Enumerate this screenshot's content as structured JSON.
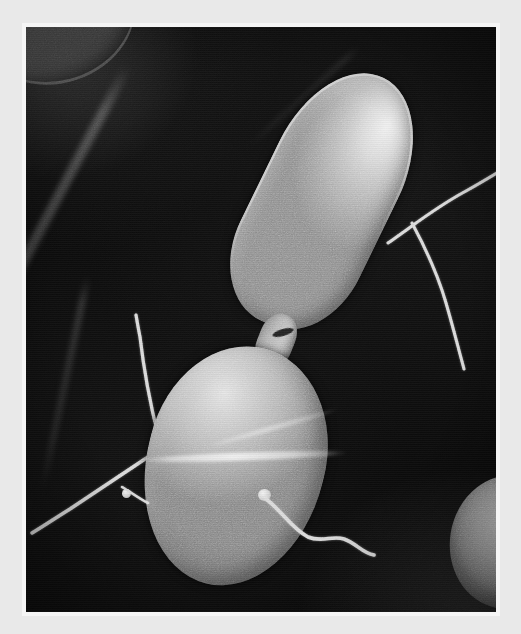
{
  "image": {
    "kind": "sem-micrograph",
    "subject": "two dividing rod-shaped bacteria with flagella",
    "modality": "scanning electron microscope",
    "color_mode": "grayscale",
    "caption": "",
    "width_px": 521,
    "height_px": 634
  },
  "frame": {
    "mat_color": "#e9e9e9",
    "bevel_color": "#f5f5f5",
    "photo_left": 26,
    "photo_top": 27,
    "photo_width": 470,
    "photo_height": 585
  },
  "palette": {
    "background_black": "#0a0a0a",
    "substrate_gray": "#1c1c1c",
    "cell_midtone": "#b4b4b4",
    "cell_highlight": "#efefef",
    "cell_shadow": "#868686",
    "filament_white": "#d8d8d8",
    "corner_cell_dim": "#585858"
  },
  "features": {
    "cells": [
      {
        "id": "cell-upper",
        "label": "upper elongated bacterium",
        "shape": "rod / elongated ovoid",
        "rotation_deg": 26,
        "x": 232,
        "y": 37,
        "w": 132,
        "h": 272
      },
      {
        "id": "cell-lower",
        "label": "lower rounded bacterium",
        "shape": "ovoid / coccobacillus",
        "rotation_deg": 14,
        "x": 120,
        "y": 318,
        "w": 178,
        "h": 242
      },
      {
        "id": "cell-corner-tl",
        "label": "partial out-of-focus cell, top-left corner",
        "shape": "partial rod",
        "rotation_deg": -18,
        "x": -48,
        "y": -62,
        "w": 160,
        "h": 118
      },
      {
        "id": "cell-corner-br",
        "label": "partial bright cell, bottom-right edge",
        "shape": "partial ovoid",
        "rotation_deg": 10,
        "x": 424,
        "y": 448,
        "w": 118,
        "h": 134
      }
    ],
    "neck": {
      "id": "cell-neck",
      "label": "septum joining the two cells",
      "x": 232,
      "y": 286,
      "w": 36,
      "h": 56,
      "rotation_deg": 22
    },
    "filaments": [
      {
        "id": "flagellum-upper-right-a",
        "label": "flagellum from upper cell, trailing up-right",
        "path": "M 0,96 C 26,78 48,60 78,44 C 98,33 112,24 132,12",
        "width": 3.0
      },
      {
        "id": "flagellum-upper-right-b",
        "label": "flagellum from upper cell, trailing down-right",
        "path": "M 0,0 C 14,26 26,52 34,80 C 41,104 46,124 52,146",
        "width": 3.0
      },
      {
        "id": "fimbria-lower-up",
        "label": "filament from lower cell, pointing up",
        "path": "M 28,120 C 20,88 14,56 10,22 C 8,12 7,6 6,0",
        "width": 3.2
      },
      {
        "id": "fimbria-lower-left",
        "label": "filament from lower cell, pointing down-left",
        "path": "M 128,2 C 98,22 68,42 38,62 C 22,72 10,80 0,86",
        "width": 3.4
      },
      {
        "id": "flagellum-lower-right",
        "label": "wavy flagellum from lower cell, lower-right",
        "path": "M 0,4 C 16,16 26,34 42,42 C 56,48 66,40 78,44 C 90,48 96,58 108,60",
        "width": 3.6
      },
      {
        "id": "fimbria-lower-short",
        "label": "short stub filament on lower-left margin",
        "path": "M 0,0 C 10,6 18,12 26,16",
        "width": 2.6
      }
    ],
    "substrate_creases": [
      {
        "id": "crease-main",
        "label": "faint diagonal ridge across dark substrate"
      },
      {
        "id": "crease-lower",
        "label": "secondary faint ridge, lower-left"
      },
      {
        "id": "crease-upper",
        "label": "short faint ridge, upper-right"
      }
    ]
  }
}
